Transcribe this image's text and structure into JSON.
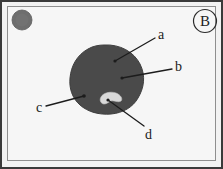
{
  "figure": {
    "panel_letter": "B",
    "panel_letter_icon": "circled-letter-badge",
    "background_color": "#f6f6f6",
    "frame_color": "#3a3a3a",
    "inner_frame_color": "#8f8f8f"
  },
  "scalebar_marker": {
    "name": "gray-disc-marker",
    "color": "#6e6e6e",
    "cx": 22,
    "cy": 20,
    "r": 10
  },
  "specimen": {
    "name": "dark-stained-mass",
    "color": "#4a4a4a",
    "description": "large irregular dark rounded mass in center of field"
  },
  "inclusion": {
    "name": "pale-inclusion",
    "color": "#d8d8d8",
    "description": "small pale crescent-shaped inclusion inside the dark mass"
  },
  "annotations": [
    {
      "id": "a",
      "label": "a",
      "label_x": 158,
      "label_y": 28,
      "leader_from_x": 155,
      "leader_from_y": 38,
      "leader_to_x": 115,
      "leader_to_y": 61,
      "target": "upper region of dark mass"
    },
    {
      "id": "b",
      "label": "b",
      "label_x": 175,
      "label_y": 60,
      "leader_from_x": 172,
      "leader_from_y": 69,
      "leader_to_x": 122,
      "leader_to_y": 78,
      "target": "mid-right region of dark mass"
    },
    {
      "id": "c",
      "label": "c",
      "label_x": 36,
      "label_y": 101,
      "leader_from_x": 46,
      "leader_from_y": 106,
      "leader_to_x": 84,
      "leader_to_y": 96,
      "target": "left margin of dark mass"
    },
    {
      "id": "d",
      "label": "d",
      "label_x": 145,
      "label_y": 128,
      "leader_from_x": 144,
      "leader_from_y": 126,
      "leader_to_x": 108,
      "leader_to_y": 100,
      "target": "pale inclusion inside dark mass"
    }
  ],
  "colors": {
    "leader_line": "#1c1c1c",
    "mass_fill": "#4a4a4a",
    "mass_edge": "#3f3f3f",
    "inclusion_fill": "#d9d9d9",
    "marker_fill": "#6e6e6e"
  }
}
